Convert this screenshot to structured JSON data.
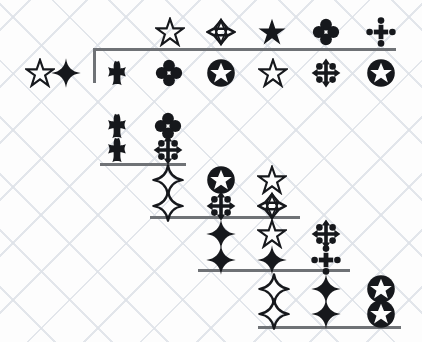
{
  "canvas": {
    "width": 422,
    "height": 342,
    "background_color": "#fdfdfd",
    "watermark": "faint diagonal crosshatch",
    "ink_color": "#16181c",
    "rule_color": "#6f7276"
  },
  "legend": {
    "glyph_names": {
      "star_outline": "star-outline-icon",
      "star_solid": "star-solid-icon",
      "star_of_david": "star-of-david-outline-icon",
      "sparkle_outline": "four-point-sparkle-outline-icon",
      "sparkle_solid": "four-point-sparkle-solid-icon",
      "clover": "four-lobe-clover-icon",
      "cross": "budded-cross-icon",
      "arrows_cross": "four-arrow-cross-icon",
      "dotted_cross": "dotted-four-arrow-cross-icon",
      "circled_star": "circled-star-icon"
    }
  },
  "symbols": [
    {
      "id": "s1",
      "type": "star_outline",
      "label": "star-outline",
      "x": 170,
      "y": 32
    },
    {
      "id": "s2",
      "type": "star_of_david",
      "label": "star-of-david",
      "x": 221,
      "y": 32
    },
    {
      "id": "s3",
      "type": "star_solid",
      "label": "star-solid",
      "x": 272,
      "y": 32
    },
    {
      "id": "s4",
      "type": "clover",
      "label": "clover",
      "x": 326,
      "y": 32
    },
    {
      "id": "s5",
      "type": "dotted_cross",
      "label": "dotted-arrow-cross",
      "x": 381,
      "y": 32
    },
    {
      "id": "s6",
      "type": "star_outline",
      "label": "star-outline",
      "x": 40,
      "y": 73
    },
    {
      "id": "s7",
      "type": "sparkle_solid",
      "label": "sparkle-solid",
      "x": 66,
      "y": 73
    },
    {
      "id": "s8",
      "type": "cross",
      "label": "budded-cross",
      "x": 117,
      "y": 73
    },
    {
      "id": "s9",
      "type": "clover",
      "label": "clover",
      "x": 169,
      "y": 73
    },
    {
      "id": "s10",
      "type": "circled_star",
      "label": "circled-star",
      "x": 221,
      "y": 73
    },
    {
      "id": "s11",
      "type": "star_outline",
      "label": "star-outline",
      "x": 273,
      "y": 73
    },
    {
      "id": "s12",
      "type": "arrows_cross",
      "label": "arrow-cross",
      "x": 326,
      "y": 73
    },
    {
      "id": "s13",
      "type": "circled_star",
      "label": "circled-star",
      "x": 381,
      "y": 73
    },
    {
      "id": "s14",
      "type": "cross",
      "label": "budded-cross",
      "x": 117,
      "y": 126
    },
    {
      "id": "s15",
      "type": "clover",
      "label": "clover",
      "x": 168,
      "y": 126
    },
    {
      "id": "s16",
      "type": "cross",
      "label": "budded-cross",
      "x": 117,
      "y": 150
    },
    {
      "id": "s17",
      "type": "arrows_cross",
      "label": "arrow-cross",
      "x": 168,
      "y": 150
    },
    {
      "id": "s18",
      "type": "sparkle_outline",
      "label": "sparkle-outline",
      "x": 168,
      "y": 180
    },
    {
      "id": "s19",
      "type": "circled_star",
      "label": "circled-star",
      "x": 221,
      "y": 180
    },
    {
      "id": "s20",
      "type": "star_outline",
      "label": "star-outline",
      "x": 272,
      "y": 180
    },
    {
      "id": "s21",
      "type": "sparkle_outline",
      "label": "sparkle-outline",
      "x": 168,
      "y": 206
    },
    {
      "id": "s22",
      "type": "arrows_cross",
      "label": "arrow-cross",
      "x": 221,
      "y": 206
    },
    {
      "id": "s23",
      "type": "star_of_david",
      "label": "star-of-david",
      "x": 272,
      "y": 206
    },
    {
      "id": "s24",
      "type": "sparkle_solid",
      "label": "sparkle-solid",
      "x": 221,
      "y": 234
    },
    {
      "id": "s25",
      "type": "star_outline",
      "label": "star-outline",
      "x": 272,
      "y": 234
    },
    {
      "id": "s26",
      "type": "arrows_cross",
      "label": "arrow-cross",
      "x": 326,
      "y": 234
    },
    {
      "id": "s27",
      "type": "sparkle_solid",
      "label": "sparkle-solid",
      "x": 221,
      "y": 260
    },
    {
      "id": "s28",
      "type": "sparkle_solid",
      "label": "sparkle-solid",
      "x": 272,
      "y": 260
    },
    {
      "id": "s29",
      "type": "dotted_cross",
      "label": "dotted-arrow-cross",
      "x": 326,
      "y": 260
    },
    {
      "id": "s30",
      "type": "sparkle_outline",
      "label": "sparkle-outline",
      "x": 274,
      "y": 289
    },
    {
      "id": "s31",
      "type": "sparkle_solid",
      "label": "sparkle-solid",
      "x": 326,
      "y": 289
    },
    {
      "id": "s32",
      "type": "circled_star",
      "label": "circled-star",
      "x": 381,
      "y": 289
    },
    {
      "id": "s33",
      "type": "sparkle_outline",
      "label": "sparkle-outline",
      "x": 274,
      "y": 314
    },
    {
      "id": "s34",
      "type": "sparkle_solid",
      "label": "sparkle-solid",
      "x": 326,
      "y": 314
    },
    {
      "id": "s35",
      "type": "circled_star",
      "label": "circled-star",
      "x": 381,
      "y": 314
    }
  ],
  "rules": [
    {
      "id": "r1",
      "label": "bracket-rule-row1",
      "x": 93,
      "y": 48,
      "width": 303
    },
    {
      "id": "r2",
      "label": "rule-row4",
      "x": 100,
      "y": 163,
      "width": 86
    },
    {
      "id": "r3",
      "label": "rule-row6",
      "x": 150,
      "y": 216,
      "width": 150
    },
    {
      "id": "r4",
      "label": "rule-row8",
      "x": 198,
      "y": 269,
      "width": 152
    },
    {
      "id": "r5",
      "label": "rule-row10",
      "x": 258,
      "y": 326,
      "width": 143
    }
  ],
  "vertical_rules": [
    {
      "id": "v1",
      "label": "bracket-tick-left",
      "x": 93,
      "y": 48,
      "height": 35
    }
  ]
}
